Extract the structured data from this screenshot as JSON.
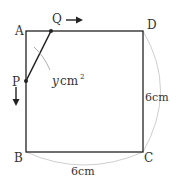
{
  "diagram": {
    "vertices": {
      "A": "A",
      "B": "B",
      "C": "C",
      "D": "D"
    },
    "points": {
      "P": "P",
      "Q": "Q"
    },
    "area_label": {
      "var": "y",
      "unit": "cm",
      "exp": "2"
    },
    "side_labels": {
      "right": "6cm",
      "bottom": "6cm"
    },
    "colors": {
      "line": "#222222",
      "arc": "#cccccc",
      "text": "#333333"
    }
  }
}
